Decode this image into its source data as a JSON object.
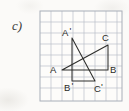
{
  "exercise": {
    "item_label": "c)"
  },
  "figure": {
    "caption_letter": "c)",
    "grid": {
      "columns": 7,
      "rows": 8,
      "cell_size_px": 11,
      "line_color": "#b9bfc9",
      "border_color": "#a8aeb8",
      "background_color": "#fdfcfa"
    },
    "stroke_color": "#2e2e2c",
    "vertices": [
      {
        "name": "A",
        "label": "A",
        "x": 23,
        "y": 60,
        "label_x": 11,
        "label_y": 62
      },
      {
        "name": "B",
        "label": "B",
        "x": 69,
        "y": 60,
        "label_x": 71,
        "label_y": 63
      },
      {
        "name": "C",
        "label": "C",
        "x": 69,
        "y": 35,
        "label_x": 64,
        "label_y": 30
      },
      {
        "name": "Ap",
        "label": "A",
        "prime": "'",
        "x": 33,
        "y": 28,
        "label_x": 24,
        "label_y": 25
      },
      {
        "name": "Bp",
        "label": "B",
        "prime": "'",
        "x": 33,
        "y": 71,
        "label_x": 26,
        "label_y": 80
      },
      {
        "name": "Cp",
        "label": "C",
        "prime": "'",
        "x": 56,
        "y": 71,
        "label_x": 56,
        "label_y": 81
      }
    ],
    "triangles": [
      {
        "name": "triangle-ABC",
        "points": "23,60 69,60 69,35"
      },
      {
        "name": "triangle-A'B'C'",
        "points": "33,28 33,71 56,71"
      }
    ]
  }
}
